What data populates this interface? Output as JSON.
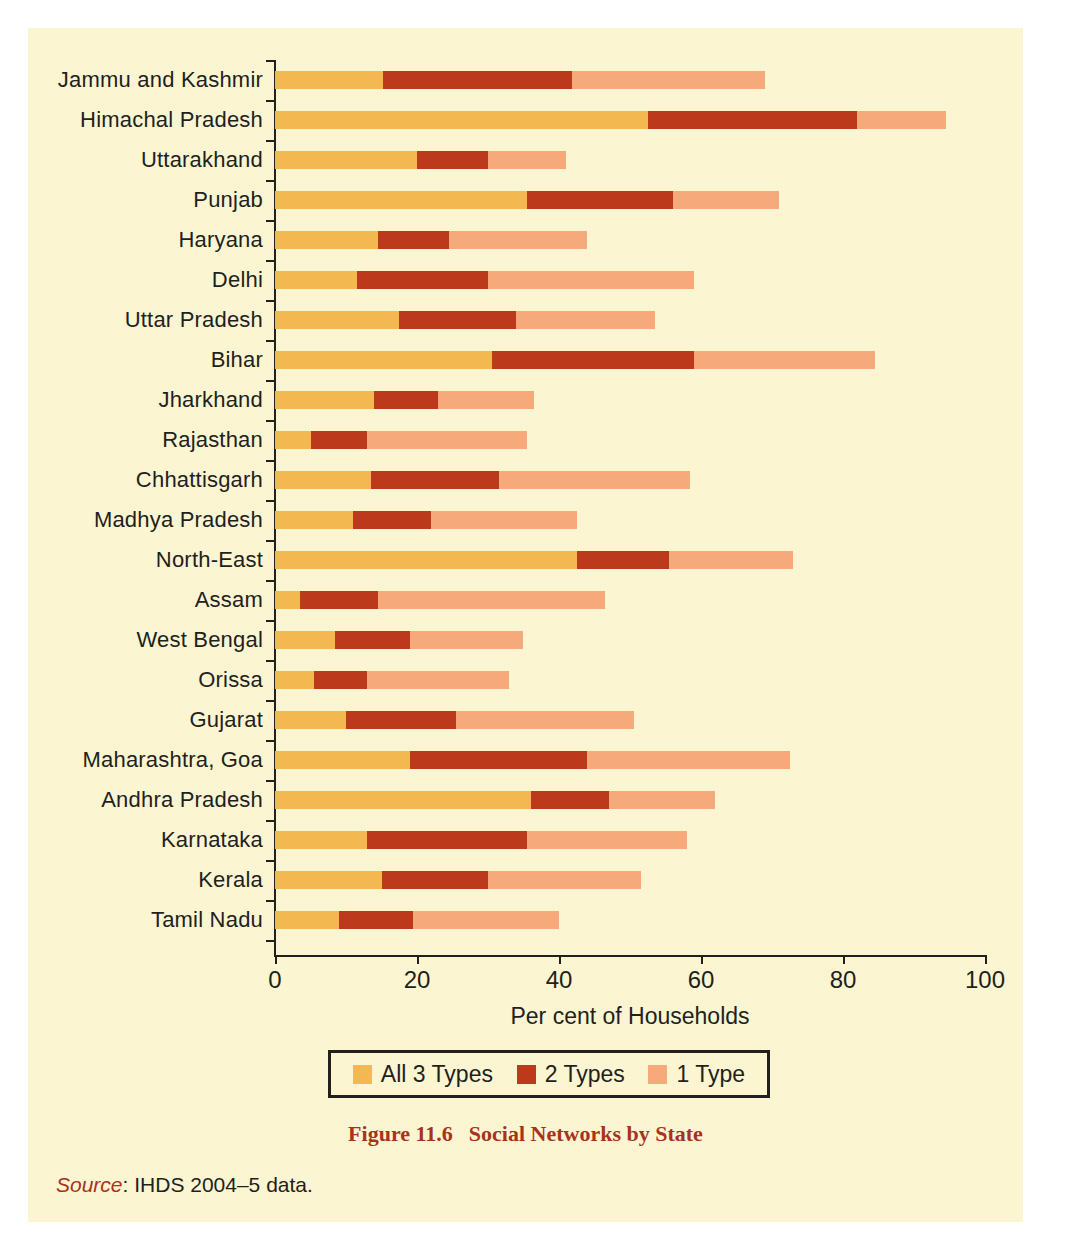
{
  "figure": {
    "caption_number": "Figure 11.6",
    "caption_title": "Social Networks by State",
    "source_key": "Source",
    "source_text": ": IHDS 2004–5 data."
  },
  "colors": {
    "page_background": "#FBF5D2",
    "axis": "#231f1c",
    "all_3_types": "#F4B851",
    "two_types": "#BC3A1B",
    "one_type": "#F6A97B",
    "caption": "#A8331C"
  },
  "chart_data": {
    "type": "bar",
    "orientation": "horizontal",
    "stacked": true,
    "title": "Social Networks by State",
    "xlabel": "Per cent of Households",
    "ylabel": "",
    "xlim": [
      0,
      100
    ],
    "xticks": [
      0,
      20,
      40,
      60,
      80,
      100
    ],
    "xtick_labels": [
      "0",
      "20",
      "40",
      "60",
      "80",
      "100"
    ],
    "grid": false,
    "legend_position": "bottom",
    "categories": [
      "Jammu and Kashmir",
      "Himachal Pradesh",
      "Uttarakhand",
      "Punjab",
      "Haryana",
      "Delhi",
      "Uttar Pradesh",
      "Bihar",
      "Jharkhand",
      "Rajasthan",
      "Chhattisgarh",
      "Madhya Pradesh",
      "North-East",
      "Assam",
      "West Bengal",
      "Orissa",
      "Gujarat",
      "Maharashtra, Goa",
      "Andhra Pradesh",
      "Karnataka",
      "Kerala",
      "Tamil Nadu"
    ],
    "series": [
      {
        "name": "All 3 Types",
        "color": "#F4B851",
        "values": [
          15.2,
          52.5,
          20.0,
          35.5,
          14.5,
          11.5,
          17.5,
          30.5,
          14.0,
          5.0,
          13.5,
          11.0,
          42.5,
          3.5,
          8.5,
          5.5,
          10.0,
          19.0,
          36.0,
          13.0,
          15.0,
          9.0
        ]
      },
      {
        "name": "2 Types",
        "color": "#BC3A1B",
        "values": [
          26.6,
          29.5,
          10.0,
          20.5,
          10.0,
          18.5,
          16.5,
          28.5,
          9.0,
          8.0,
          18.0,
          11.0,
          13.0,
          11.0,
          10.5,
          7.5,
          15.5,
          25.0,
          11.0,
          22.5,
          15.0,
          10.5
        ]
      },
      {
        "name": "1 Type",
        "color": "#F6A97B",
        "values": [
          27.2,
          12.5,
          11.0,
          15.0,
          19.5,
          29.0,
          19.5,
          25.5,
          13.5,
          22.5,
          27.0,
          20.5,
          17.5,
          32.0,
          16.0,
          20.0,
          25.0,
          28.5,
          15.0,
          22.5,
          21.5,
          20.5
        ]
      }
    ],
    "totals": [
      69.0,
      94.5,
      41.0,
      71.0,
      44.0,
      59.0,
      53.5,
      84.5,
      36.5,
      35.5,
      58.5,
      42.5,
      73.0,
      46.5,
      35.0,
      33.0,
      50.5,
      72.5,
      62.0,
      58.0,
      51.5,
      40.0
    ]
  },
  "legend": {
    "items": [
      {
        "label": "All 3 Types",
        "color": "#F4B851"
      },
      {
        "label": "2 Types",
        "color": "#BC3A1B"
      },
      {
        "label": "1 Type",
        "color": "#F6A97B"
      }
    ]
  }
}
